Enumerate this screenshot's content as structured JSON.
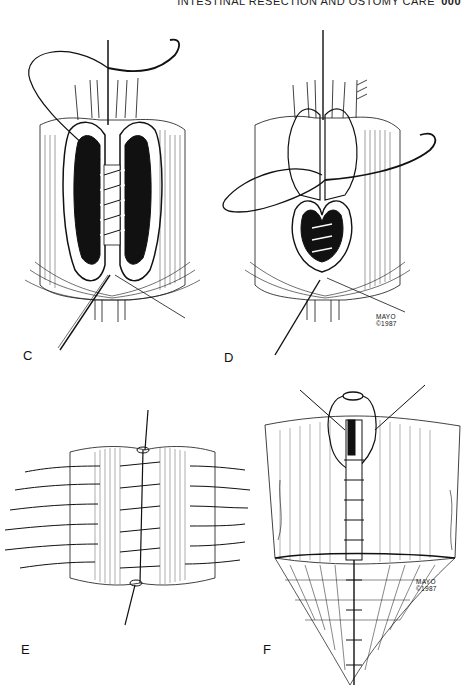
{
  "running_head": {
    "title": "INTESTINAL RESECTION AND OSTOMY CARE",
    "page": "000"
  },
  "figures": [
    {
      "label": "C",
      "description": "Open bowel ends with posterior running suture; needle and curved thread above"
    },
    {
      "label": "D",
      "description": "Anterior layer closure with curved needle looping thread",
      "credit": [
        "MAYO",
        "©1987"
      ]
    },
    {
      "label": "E",
      "description": "Completed seromuscular anastomosis with interrupted sutures on both sides"
    },
    {
      "label": "F",
      "description": "Closed anastomosis with tied knot above and mesentery below",
      "credit": [
        "MAYO",
        "©1987"
      ]
    }
  ],
  "colors": {
    "ink": "#111111",
    "paper": "#ffffff"
  }
}
